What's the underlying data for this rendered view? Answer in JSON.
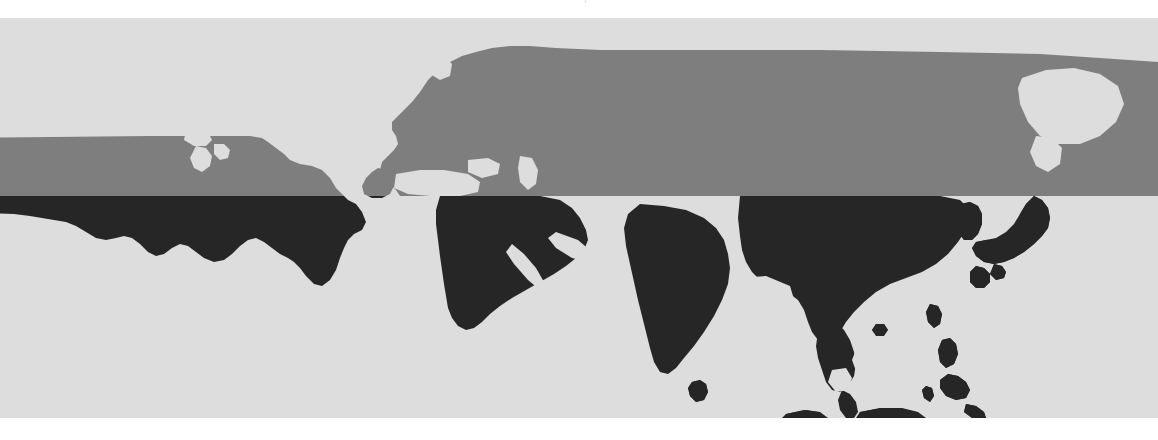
{
  "figure": {
    "caption_clipped": "—————  |  ————",
    "width_px": 1158,
    "height_px": 440
  },
  "map": {
    "title": "world-map",
    "projection_note": "equirectangular crop, northern hemisphere band",
    "canvas": {
      "top_px": 18,
      "height_px": 400,
      "background_color": "#dddddd"
    },
    "split_line": {
      "label": "horizontal tone division",
      "y_px": 178,
      "upper_color": "#7e7e7e",
      "lower_color": "#262626"
    },
    "legend": {
      "upper_band_label": "",
      "lower_band_label": ""
    },
    "regions": [
      {
        "name": "united-states",
        "band": "upper",
        "color": "#7e7e7e"
      },
      {
        "name": "united-states-south",
        "band": "lower",
        "color": "#262626"
      },
      {
        "name": "europe",
        "band": "upper",
        "color": "#7e7e7e"
      },
      {
        "name": "russia-siberia",
        "band": "upper",
        "color": "#7e7e7e"
      },
      {
        "name": "middle-east",
        "band": "lower",
        "color": "#262626"
      },
      {
        "name": "arabian-peninsula",
        "band": "lower",
        "color": "#262626"
      },
      {
        "name": "india",
        "band": "lower",
        "color": "#262626"
      },
      {
        "name": "china",
        "band": "lower",
        "color": "#262626"
      },
      {
        "name": "southeast-asia",
        "band": "lower",
        "color": "#262626"
      },
      {
        "name": "japan",
        "band": "lower",
        "color": "#262626"
      },
      {
        "name": "korea",
        "band": "lower",
        "color": "#262626"
      },
      {
        "name": "philippines",
        "band": "lower",
        "color": "#262626"
      },
      {
        "name": "indonesia",
        "band": "lower",
        "color": "#262626"
      },
      {
        "name": "sri-lanka",
        "band": "lower",
        "color": "#262626"
      },
      {
        "name": "taiwan",
        "band": "lower",
        "color": "#262626"
      },
      {
        "name": "kamchatka-sakhalin",
        "band": "water",
        "color": "#dddddd"
      }
    ],
    "colors": {
      "background": "#dddddd",
      "land_upper": "#7e7e7e",
      "land_lower": "#262626",
      "page": "#ffffff"
    }
  }
}
